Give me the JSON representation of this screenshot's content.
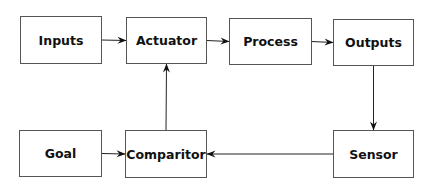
{
  "diagram": {
    "type": "block-diagram",
    "nodes": [
      {
        "id": "inputs",
        "label": "Inputs"
      },
      {
        "id": "actuator",
        "label": "Actuator"
      },
      {
        "id": "process",
        "label": "Process"
      },
      {
        "id": "outputs",
        "label": "Outputs"
      },
      {
        "id": "goal",
        "label": "Goal"
      },
      {
        "id": "comparitor",
        "label": "Comparitor"
      },
      {
        "id": "sensor",
        "label": "Sensor"
      }
    ],
    "edges": [
      {
        "from": "inputs",
        "to": "actuator"
      },
      {
        "from": "actuator",
        "to": "process"
      },
      {
        "from": "process",
        "to": "outputs"
      },
      {
        "from": "outputs",
        "to": "sensor"
      },
      {
        "from": "sensor",
        "to": "comparitor"
      },
      {
        "from": "goal",
        "to": "comparitor"
      },
      {
        "from": "comparitor",
        "to": "actuator"
      }
    ],
    "colors": {
      "stroke": "#555555",
      "arrow": "#111111",
      "text": "#111111",
      "background": "#ffffff"
    }
  }
}
